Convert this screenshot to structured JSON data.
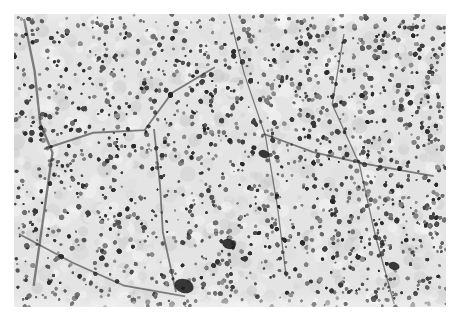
{
  "image": {
    "kind": "histology-micrograph",
    "color_mode": "grayscale",
    "description": "Light-microscopy section showing densely packed round-to-polygonal cells arranged in nests separated by thin dark fibrovascular septa",
    "colors": {
      "background": "#ffffff",
      "tissue_base": "#dcdcdc",
      "nucleus": "#4a4a4a",
      "septa": "#2a2a2a"
    }
  }
}
